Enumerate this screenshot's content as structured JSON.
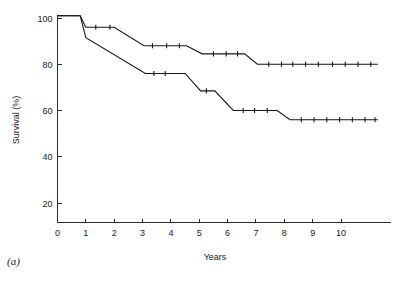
{
  "figure": {
    "panel_label": "(a)"
  },
  "chart_data": {
    "type": "line",
    "title": "",
    "subtitle": "",
    "xlabel": "Years",
    "ylabel": "Survival (%)",
    "xlim": [
      0,
      11.7
    ],
    "ylim": [
      0,
      104
    ],
    "xticks": [
      0,
      1,
      2,
      3,
      4,
      5,
      6,
      7,
      8,
      9,
      10
    ],
    "xticklabels": [
      "0",
      "1",
      "2",
      "3",
      "4",
      "5",
      "6",
      "7",
      "8",
      "9",
      "10"
    ],
    "yticks": [
      20,
      40,
      60,
      80,
      100
    ],
    "yticklabels": [
      "20",
      "40",
      "60",
      "80",
      "100"
    ],
    "grid": false,
    "legend": "none",
    "step_style": "post-linear-interpolated",
    "series": [
      {
        "name": "upper-survival-curve",
        "points": [
          [
            0.0,
            101.0
          ],
          [
            0.8,
            101.0
          ],
          [
            1.0,
            96.0
          ],
          [
            1.2,
            96.0
          ],
          [
            2.0,
            96.0
          ],
          [
            3.05,
            88.0
          ],
          [
            4.55,
            88.0
          ],
          [
            5.1,
            84.5
          ],
          [
            6.6,
            84.5
          ],
          [
            7.05,
            80.0
          ],
          [
            11.3,
            80.0
          ]
        ],
        "censor_marks": [
          [
            1.35,
            96.0
          ],
          [
            1.85,
            96.0
          ],
          [
            3.35,
            88.0
          ],
          [
            3.85,
            88.0
          ],
          [
            4.3,
            88.0
          ],
          [
            5.5,
            84.5
          ],
          [
            5.95,
            84.5
          ],
          [
            6.35,
            84.5
          ],
          [
            7.45,
            80.0
          ],
          [
            7.9,
            80.0
          ],
          [
            8.3,
            80.0
          ],
          [
            8.75,
            80.0
          ],
          [
            9.2,
            80.0
          ],
          [
            9.7,
            80.0
          ],
          [
            10.15,
            80.0
          ],
          [
            10.6,
            80.0
          ],
          [
            11.05,
            80.0
          ]
        ]
      },
      {
        "name": "lower-survival-curve",
        "points": [
          [
            0.0,
            101.0
          ],
          [
            0.8,
            101.0
          ],
          [
            1.0,
            91.5
          ],
          [
            3.1,
            76.0
          ],
          [
            4.05,
            76.0
          ],
          [
            4.5,
            76.0
          ],
          [
            5.05,
            68.5
          ],
          [
            5.55,
            68.5
          ],
          [
            6.2,
            60.0
          ],
          [
            7.75,
            60.0
          ],
          [
            8.2,
            56.0
          ],
          [
            11.3,
            56.0
          ]
        ],
        "censor_marks": [
          [
            3.4,
            76.0
          ],
          [
            3.8,
            76.0
          ],
          [
            5.25,
            68.5
          ],
          [
            6.55,
            60.0
          ],
          [
            6.95,
            60.0
          ],
          [
            7.4,
            60.0
          ],
          [
            8.6,
            56.0
          ],
          [
            9.05,
            56.0
          ],
          [
            9.5,
            56.0
          ],
          [
            9.95,
            56.0
          ],
          [
            10.4,
            56.0
          ],
          [
            10.85,
            56.0
          ],
          [
            11.2,
            56.0
          ]
        ]
      }
    ],
    "colors": {
      "axis": "#2b2b2b",
      "curve": "#151515",
      "background": "#ffffff"
    }
  }
}
